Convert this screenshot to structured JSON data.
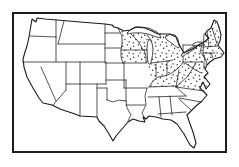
{
  "meta": {
    "figure_name": "us-range-map"
  },
  "colors": {
    "ink": "#1c1c1c",
    "paper": "#ffffff"
  },
  "range": {
    "shading": "stipple-dots",
    "stippled_states": [
      "Minnesota",
      "Iowa",
      "Wisconsin",
      "Michigan",
      "Illinois",
      "Indiana",
      "Ohio",
      "Kentucky",
      "West Virginia",
      "Virginia",
      "Maryland",
      "Delaware",
      "Pennsylvania",
      "New Jersey",
      "New York",
      "Connecticut",
      "Rhode Island",
      "Massachusetts",
      "Vermont",
      "New Hampshire",
      "Maine"
    ]
  },
  "map": {
    "stipple": {
      "dot_color": "#1c1c1c",
      "dot_radius": 0.7,
      "tile_size": 11
    },
    "paths": {
      "stipple_region": "M118,28 L126,31 L134,30 L142,28 L150,30 L157,30 L163,34 L172,35 L177,42 L179,49 L182,55 L186,53 L192,48 L197,42 L209,37 L205,33 L207,31 L211,28 L214,20 L217,22 L219,27 L221,35 L220,41 L218,45 L221,49 L223,53 L221,56 L214,58 L210,62 L207,65 L205,69 L207,73 L204,77 L206,79 L209,84 L206,88 L203,82 L200,87 L203,91 L176,87 L149,87 L153,81 L149,76 L149,70 L146,63 L123,63 L121,57 L121,50 L122,44 L122,36 Z",
      "us_outline": "M31,25 L32,19 L36,22 L37,18 L45,19 L57,20 L80,22 L105,24 L112,25 L114,27 L118,28 L124,31 L130,30 L136,27 L145,28 L152,31 L158,34 L164,34 L170,34 L176,37 L178,42 L181,48 L184,53 L190,50 L196,47 L200,44 L204,42 L209,38 L205,34 L207,31 L211,28 L214,20 L217,22 L219,27 L221,35 L220,41 L218,45 L221,49 L224,53 L221,57 L214,59 L210,62 L207,65 L205,69 L208,73 L204,77 L206,79 L210,84 L206,89 L203,82 L200,88 L204,92 L207,95 L202,101 L196,106 L190,112 L187,115 L189,121 L193,132 L196,143 L194,148 L190,145 L184,134 L177,124 L171,120 L163,119 L156,117 L149,116 L146,119 L143,117 L145,122 L139,121 L133,119 L128,122 L122,129 L116,136 L113,141 L109,134 L104,126 L99,121 L97,117 L80,116 L75,114 L60,109 L52,105 L43,103 L39,98 L33,88 L27,77 L24,67 L23,59 L25,52 L27,46 L29,37 Z",
      "state_lines": "M30,36 L56,37 M56,20 L56,37 M64,21 L58,44 M56,37 L56,62 M23,62 L105,62 M58,44 L105,44 M105,24 L105,62 M106,62 L106,84 M41,67 L56,101 M66,62 L66,90 M66,90 L53,105 M66,84 L106,84 M80,62 L80,116 M105,33 L120,33 M105,48 L121,48 M105,63 L124,63 M118,28 L122,36 L122,44 L121,50 L121,57 L123,63 M121,50 L144,50 M123,63 L146,63 M124,63 L124,88 M124,88 L147,88 M106,80 L126,80 M97,84 L97,117 M97,88 L107,88 M107,88 L107,100 M107,100 L113,102 L119,100 L126,101 M126,80 L126,101 M126,101 L127,108 L131,115 L128,121 M126,105 L145,105 M147,88 L145,96 L146,105 L142,113 L145,119 M148,97 L186,96 M159,97 L161,117 M170,96 L172,115 M158,114 L186,112 M149,87 L176,86 M176,87 L204,91 M186,96 L176,87 M179,98 L201,102 M179,99 L191,110 M153,81 L158,77 L164,76 L170,74 L176,70 L181,65 L183,62 M153,81 L149,87 M156,64 L156,77 M144,50 L150,49 M131,34 L137,40 L141,46 L143,50 M147,35 L152,41 M144,50 L146,56 L146,63 M151,63 L160,62 L173,60 M167,61 L167,74 M183,45 L183,62 M183,45 L202,45 M202,45 L200,52 L205,58 L207,63 M183,62 L203,62 M204,62 L204,69 M185,63 L194,69 L201,73 M196,63 L188,76 L176,87 M176,87 L179,70 M204,34 L203,53 M207,32 L209,47 M212,28 L217,44 M203,47 L218,46 M203,53 L215,53 M211,53 L213,58 M203,53 L205,61",
      "lakes": "M127,33 Q133,26 141,27 Q150,27 157,32 Q160,34 161,38 Q155,37 148,34 Q140,32 133,33 Q129,34 127,33 Z M149,39 Q153,42 153,49 Q153,56 151,62 Q150,66 148,63 Q147,56 147,48 Q147,42 149,39 Z M165,37 Q169,33 175,35 Q179,38 179,45 Q180,48 178,48 Q174,45 170,42 Q166,40 165,37 Z M181,55 Q185,51 191,48 Q196,45 196,48 Q191,51 186,54 Q182,58 181,55 Z M193,44 Q197,41 202,42 Q204,43 202,45 Q197,45 194,46 Q192,46 193,44 Z"
    },
    "frame": {
      "x": 13,
      "y": 13,
      "width": 213,
      "height": 139
    }
  }
}
